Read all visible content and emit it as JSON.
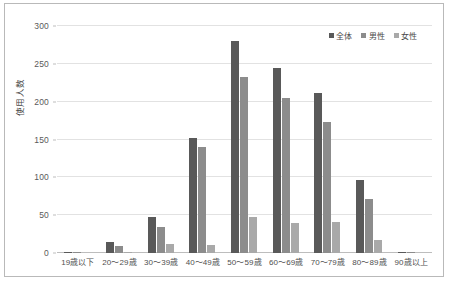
{
  "chart_data": {
    "type": "bar",
    "title": "",
    "xlabel": "",
    "ylabel": "使用人数",
    "ylim": [
      0,
      300
    ],
    "ytick_values": [
      0,
      50,
      100,
      150,
      200,
      250,
      300
    ],
    "ytick_labels": [
      "0",
      "50",
      "100",
      "150",
      "200",
      "250",
      "300"
    ],
    "grid": true,
    "legend_position": "top-right",
    "categories": [
      "19歳以下",
      "20～29歳",
      "30～39歳",
      "40～49歳",
      "50～59歳",
      "60～69歳",
      "70～79歳",
      "80～89歳",
      "90歳以上"
    ],
    "series": [
      {
        "name": "全体",
        "color": "#595959",
        "values": [
          1,
          15,
          47,
          152,
          280,
          245,
          212,
          96,
          2
        ]
      },
      {
        "name": "男性",
        "color": "#8c8c8c",
        "values": [
          1,
          9,
          35,
          140,
          232,
          205,
          173,
          71,
          2
        ]
      },
      {
        "name": "女性",
        "color": "#a9a9a9",
        "values": [
          0,
          2,
          12,
          11,
          48,
          40,
          41,
          17,
          0
        ]
      }
    ]
  },
  "legend": {
    "items": [
      {
        "label": "全体",
        "color": "#595959"
      },
      {
        "label": "男性",
        "color": "#8c8c8c"
      },
      {
        "label": "女性",
        "color": "#a9a9a9"
      }
    ]
  }
}
